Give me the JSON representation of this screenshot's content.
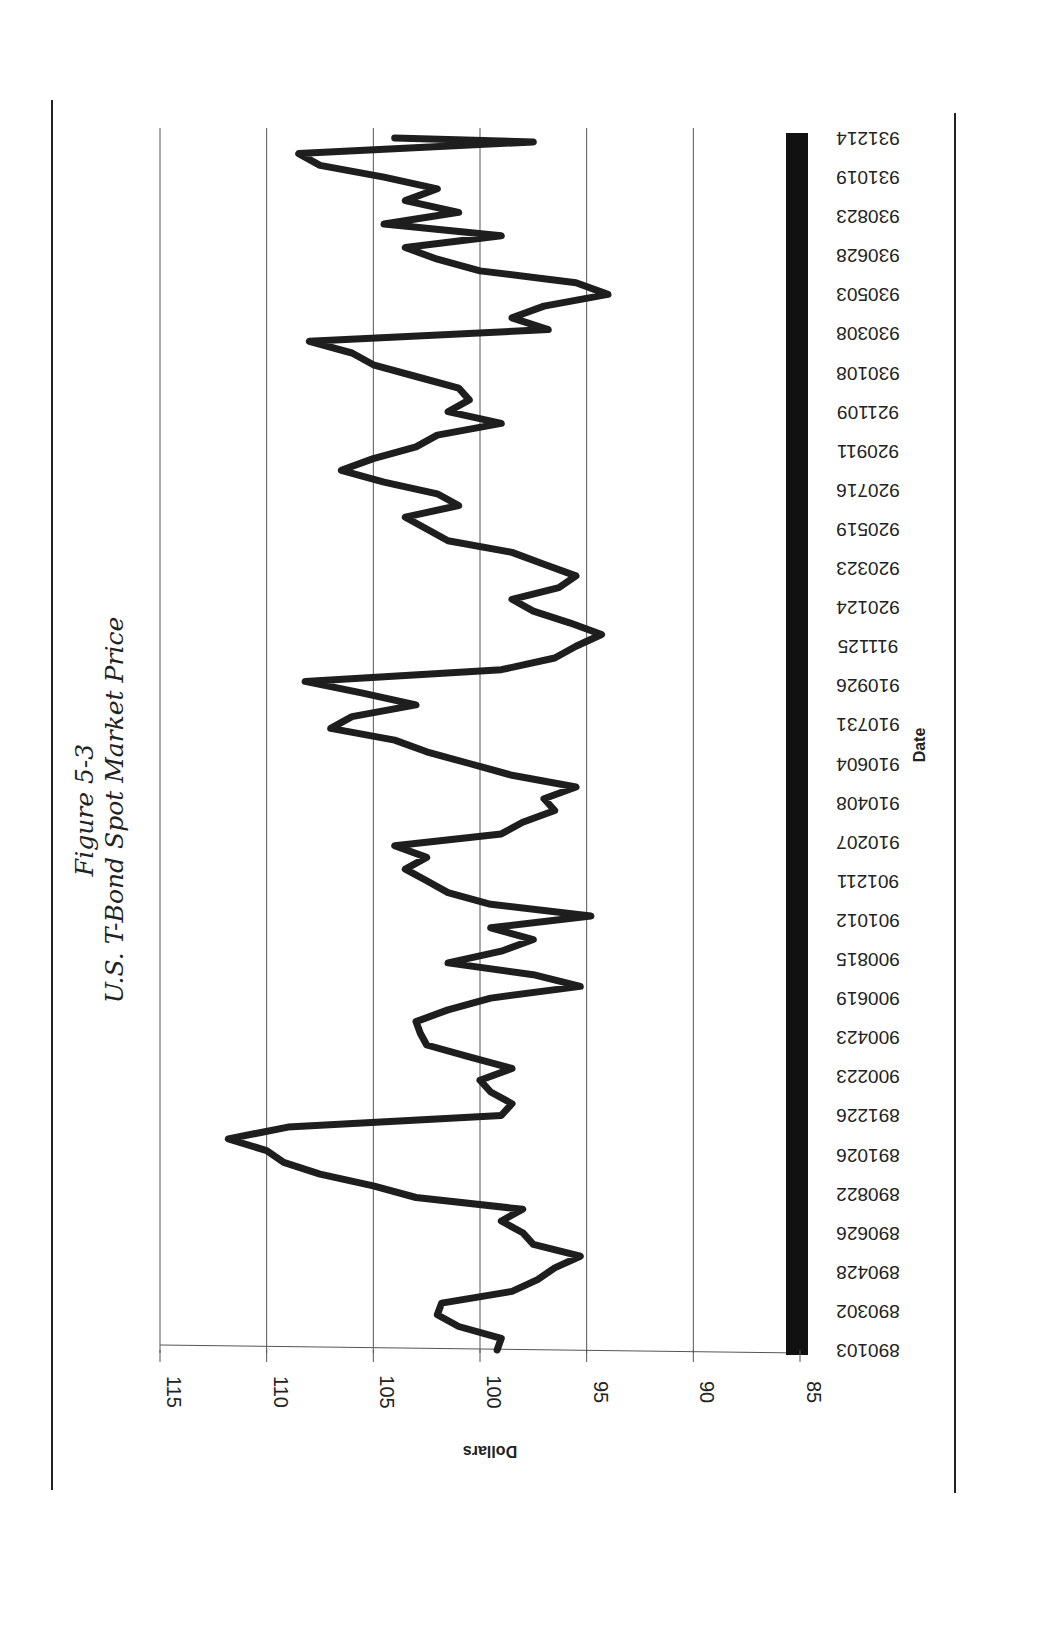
{
  "figure_label": "Figure 5-3",
  "title": "U.S. T-Bond Spot Market Price",
  "chart_data": {
    "type": "line",
    "title": "U.S. T-Bond Spot Market Price",
    "figure": "Figure 5-3",
    "xlabel": "Date",
    "ylabel": "Dollars",
    "ylim": [
      85,
      115
    ],
    "yticks": [
      115,
      110,
      105,
      100,
      95,
      90,
      85
    ],
    "grid": true,
    "orientation": "page rotated 90 degrees counter-clockwise",
    "x_tick_labels": [
      "890103",
      "890302",
      "890428",
      "890626",
      "890822",
      "891026",
      "891226",
      "900223",
      "900423",
      "900619",
      "900815",
      "901012",
      "901211",
      "910207",
      "910408",
      "910604",
      "910731",
      "910926",
      "911125",
      "920124",
      "920323",
      "920519",
      "920716",
      "920911",
      "921109",
      "930108",
      "930308",
      "930503",
      "930628",
      "930823",
      "931019",
      "931214"
    ],
    "series": [
      {
        "name": "T-Bond Spot Price",
        "x_index": [
          0,
          0.3,
          0.6,
          0.9,
          1.2,
          1.5,
          1.8,
          2.1,
          2.4,
          2.7,
          3.0,
          3.3,
          3.6,
          3.9,
          4.2,
          4.5,
          4.8,
          5.1,
          5.4,
          5.7,
          6.0,
          6.3,
          6.6,
          6.9,
          7.2,
          7.5,
          7.8,
          8.1,
          8.4,
          8.7,
          9.0,
          9.3,
          9.6,
          9.9,
          10.2,
          10.5,
          10.8,
          11.1,
          11.4,
          11.7,
          12.0,
          12.3,
          12.6,
          12.9,
          13.2,
          13.5,
          13.8,
          14.1,
          14.4,
          14.7,
          15.0,
          15.3,
          15.6,
          15.9,
          16.2,
          16.5,
          16.8,
          17.1,
          17.4,
          17.7,
          18.0,
          18.3,
          18.6,
          18.9,
          19.2,
          19.5,
          19.8,
          20.1,
          20.4,
          20.7,
          21.0,
          21.3,
          21.6,
          21.9,
          22.2,
          22.5,
          22.8,
          23.1,
          23.4,
          23.7,
          24.0,
          24.3,
          24.6,
          24.9,
          25.2,
          25.5,
          25.8,
          26.1,
          26.4,
          26.7,
          27.0,
          27.3,
          27.6,
          27.9,
          28.2,
          28.5,
          28.8,
          29.1,
          29.4,
          29.7,
          30.0,
          30.3,
          30.6,
          30.9,
          31.0
        ],
        "values": [
          99.2,
          99.0,
          101.0,
          102.0,
          101.8,
          98.5,
          97.3,
          96.5,
          95.3,
          97.5,
          98.0,
          99.0,
          98.0,
          103.0,
          105.0,
          107.5,
          109.2,
          110.0,
          111.8,
          109.0,
          99.0,
          98.5,
          99.5,
          100.0,
          98.5,
          100.5,
          102.5,
          102.8,
          103.0,
          101.5,
          99.5,
          95.3,
          97.5,
          101.5,
          99.0,
          97.5,
          99.5,
          94.8,
          99.5,
          101.5,
          102.5,
          103.5,
          102.5,
          104.0,
          99.0,
          98.0,
          96.5,
          97.0,
          95.5,
          98.5,
          100.5,
          102.5,
          104.0,
          107.0,
          106.0,
          103.0,
          105.5,
          108.2,
          99.0,
          96.5,
          95.5,
          94.3,
          95.8,
          97.5,
          98.5,
          96.3,
          95.5,
          97.0,
          98.5,
          101.5,
          102.5,
          103.5,
          101.0,
          102.0,
          104.5,
          106.5,
          105.0,
          103.0,
          102.0,
          99.0,
          101.5,
          100.5,
          101.0,
          103.0,
          105.0,
          106.0,
          108.0,
          96.8,
          98.5,
          97.0,
          94.0,
          95.5,
          100.0,
          102.0,
          103.5,
          99.0,
          104.5,
          101.0,
          103.5,
          102.0,
          104.5,
          107.5,
          108.5,
          97.5,
          104.0,
          102.5,
          105.0,
          98.0,
          99.5,
          98.5
        ]
      }
    ]
  },
  "axis": {
    "y_label": "Dollars",
    "x_label": "Date",
    "y_ticks": [
      "115",
      "110",
      "105",
      "100",
      "95",
      "90",
      "85"
    ]
  },
  "colors": {
    "line": "#1e1e1e",
    "grid": "#555555",
    "text": "#222222",
    "date_bar": "#111111"
  }
}
